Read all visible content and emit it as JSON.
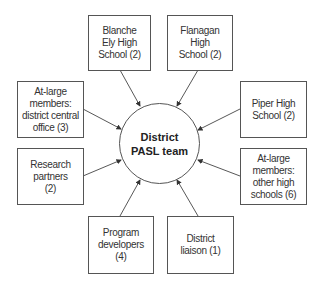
{
  "diagram": {
    "type": "hub-and-spoke",
    "hub": {
      "label": "District\nPASL team"
    },
    "nodes": [
      {
        "id": "blanche-ely",
        "label": "Blanche\nEly High\nSchool (2)"
      },
      {
        "id": "flanagan",
        "label": "Flanagan\nHigh\nSchool (2)"
      },
      {
        "id": "central-office",
        "label": "At-large\nmembers:\ndistrict central\noffice (3)"
      },
      {
        "id": "piper",
        "label": "Piper High\nSchool (2)"
      },
      {
        "id": "research-partners",
        "label": "Research\npartners\n(2)"
      },
      {
        "id": "other-high-schools",
        "label": "At-large\nmembers:\nother high\nschools (6)"
      },
      {
        "id": "program-developers",
        "label": "Program\ndevelopers\n(4)"
      },
      {
        "id": "district-liaison",
        "label": "District\nliaison (1)"
      }
    ],
    "edges_direction": "node-to-hub"
  }
}
